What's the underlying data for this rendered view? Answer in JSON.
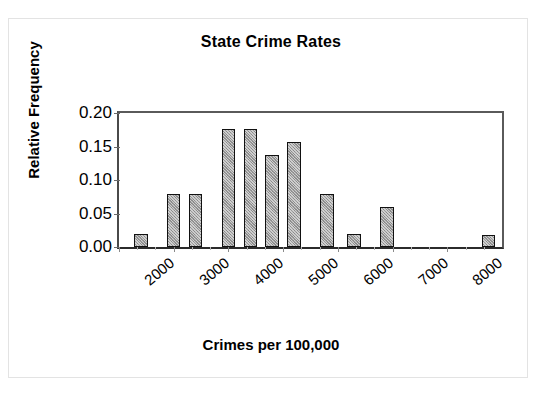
{
  "chart_data": {
    "type": "bar",
    "title": "State Crime Rates",
    "subtitle": "",
    "xlabel": "Crimes per 100,000",
    "ylabel": "Relative Frequency",
    "xlim": [
      2000,
      9000
    ],
    "ylim": [
      0.0,
      0.2
    ],
    "grid": false,
    "legend": false,
    "legend_position": "none",
    "y_ticks": [
      "0.00",
      "0.05",
      "0.10",
      "0.15",
      "0.20"
    ],
    "y_tick_values": [
      0.0,
      0.05,
      0.1,
      0.15,
      0.2
    ],
    "x_ticks": [
      "2000",
      "3000",
      "4000",
      "5000",
      "6000",
      "7000",
      "8000"
    ],
    "x_tick_values": [
      2000,
      3000,
      4000,
      5000,
      6000,
      7000,
      8000
    ],
    "bin_width": 400,
    "categories": [
      "2200-2600",
      "2800-3200",
      "3200-3600",
      "3800-4200",
      "4200-4600",
      "4600-5000",
      "5000-5400",
      "5600-6000",
      "6200-6400",
      "6800-7000",
      "8600-8900"
    ],
    "bin_centers": [
      2400,
      3000,
      3400,
      4000,
      4400,
      4800,
      5200,
      5800,
      6300,
      6900,
      8750
    ],
    "values": [
      0.02,
      0.079,
      0.079,
      0.176,
      0.176,
      0.137,
      0.157,
      0.079,
      0.02,
      0.059,
      0.018
    ],
    "bar_color": "#9a9a9a",
    "bar_edge_color": "#111111",
    "axis_color": "#4a4a4a",
    "text_color": "#000000",
    "background_color": "#ffffff"
  },
  "figure": {
    "frame_color": "#e3e3e3"
  }
}
